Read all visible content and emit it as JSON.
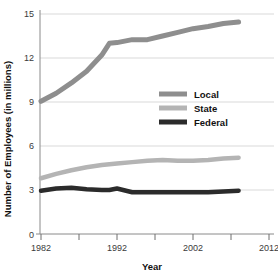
{
  "chart_data": {
    "type": "line",
    "title": "",
    "xlabel": "Year",
    "ylabel": "Number of Employees (in millions)",
    "xlim": [
      1982,
      2012
    ],
    "ylim": [
      0,
      15
    ],
    "xticks": [
      1982,
      1987,
      1992,
      1997,
      2002,
      2007,
      2012
    ],
    "xtick_labels": [
      "1982",
      "",
      "1992",
      "",
      "2002",
      "",
      "2012"
    ],
    "yticks": [
      0,
      3,
      6,
      9,
      12,
      15
    ],
    "ytick_labels": [
      "0",
      "3",
      "6",
      "9",
      "12",
      "15"
    ],
    "grid": "horizontal",
    "legend_position": "center-right",
    "x": [
      1982,
      1984,
      1986,
      1988,
      1990,
      1991,
      1992,
      1994,
      1996,
      1998,
      2000,
      2002,
      2004,
      2006,
      2008
    ],
    "series": [
      {
        "name": "Local",
        "color": "#8e8e8e",
        "values": [
          9.05,
          9.6,
          10.3,
          11.1,
          12.2,
          13.0,
          13.05,
          13.25,
          13.25,
          13.5,
          13.75,
          14.0,
          14.15,
          14.35,
          14.45
        ]
      },
      {
        "name": "State",
        "color": "#b4b4b4",
        "values": [
          3.8,
          4.1,
          4.35,
          4.55,
          4.7,
          4.75,
          4.8,
          4.9,
          5.0,
          5.05,
          5.0,
          5.0,
          5.05,
          5.15,
          5.2
        ]
      },
      {
        "name": "Federal",
        "color": "#2b2b2b",
        "values": [
          2.95,
          3.1,
          3.15,
          3.05,
          3.0,
          3.0,
          3.1,
          2.85,
          2.85,
          2.85,
          2.85,
          2.85,
          2.85,
          2.9,
          2.95
        ]
      }
    ]
  },
  "axes": {
    "x_title": "Year",
    "y_title": "Number of Employees (in millions)"
  },
  "legend": {
    "entries": [
      {
        "label": "Local",
        "color": "#8e8e8e"
      },
      {
        "label": "State",
        "color": "#b4b4b4"
      },
      {
        "label": "Federal",
        "color": "#2b2b2b"
      }
    ]
  },
  "ticks": {
    "y": [
      "15",
      "12",
      "9",
      "6",
      "3",
      "0"
    ],
    "x": [
      "1982",
      "1992",
      "2002",
      "2012"
    ]
  }
}
